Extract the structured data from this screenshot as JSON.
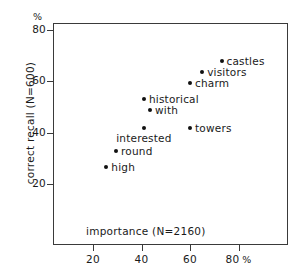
{
  "chart_data": {
    "type": "scatter",
    "title": "",
    "xlabel": "importance (N=2160)",
    "ylabel": "correct recall (N=600)",
    "x_unit": "%",
    "y_unit": "%",
    "xlim": [
      0,
      92
    ],
    "ylim": [
      3,
      86
    ],
    "grid": false,
    "legend": "none",
    "xticks": [
      20,
      40,
      60,
      80
    ],
    "yticks": [
      20,
      40,
      60,
      80
    ],
    "xtick_labels": [
      "20",
      "40",
      "60",
      "80"
    ],
    "ytick_labels": [
      "20",
      "40",
      "60",
      "80"
    ],
    "x_axis_unit_suffix": "%",
    "y_axis_unit_marker": "%",
    "points": [
      {
        "label": "castles",
        "x": 73,
        "y": 68,
        "label_pos": "right"
      },
      {
        "label": "visitors",
        "x": 65,
        "y": 63.5,
        "label_pos": "right"
      },
      {
        "label": "charm",
        "x": 60,
        "y": 59.5,
        "label_pos": "right"
      },
      {
        "label": "historical",
        "x": 41,
        "y": 53,
        "label_pos": "right"
      },
      {
        "label": "with",
        "x": 43.5,
        "y": 49,
        "label_pos": "right"
      },
      {
        "label": "towers",
        "x": 60,
        "y": 42,
        "label_pos": "right"
      },
      {
        "label": "interested",
        "x": 41,
        "y": 42,
        "label_pos": "below"
      },
      {
        "label": "round",
        "x": 29.5,
        "y": 33,
        "label_pos": "right"
      },
      {
        "label": "high",
        "x": 25.5,
        "y": 26.5,
        "label_pos": "right"
      }
    ]
  }
}
